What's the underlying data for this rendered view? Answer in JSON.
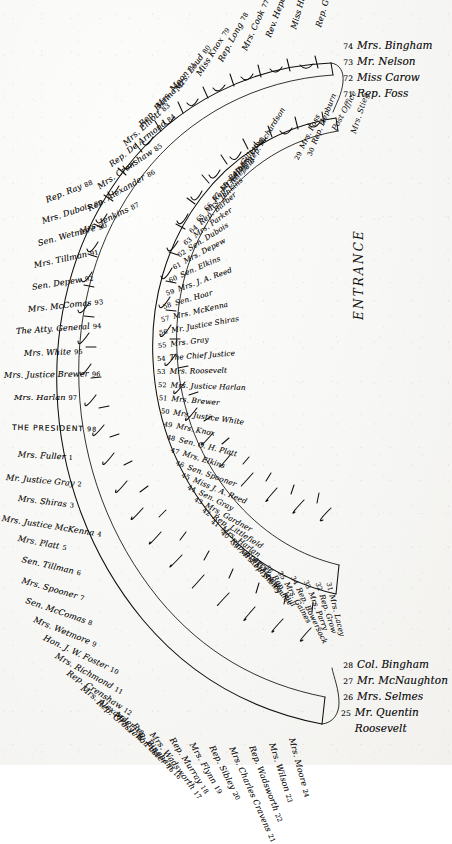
{
  "document": {
    "title": "White House Dinner Seating Chart",
    "type": "horseshoe-table-seating-plan",
    "entrance_label": "ENTRANCE",
    "post_office_label": "Post Office",
    "secondary_vertical_label": "Mrs. Stieg",
    "ink_color": "#100f0d",
    "paper_color": "#f7f7f5"
  },
  "legend_top": {
    "items": [
      {
        "num": "74",
        "name": "Mrs. Bingham"
      },
      {
        "num": "73",
        "name": "Mr. Nelson"
      },
      {
        "num": "72",
        "name": "Miss Carow"
      },
      {
        "num": "71",
        "name": "Rep. Foss"
      }
    ]
  },
  "legend_bottom": {
    "items": [
      {
        "num": "28",
        "name": "Col. Bingham"
      },
      {
        "num": "27",
        "name": "Mr. McNaughton"
      },
      {
        "num": "26",
        "name": "Mrs. Selmes"
      },
      {
        "num": "25",
        "name": "Mr. Quentin Roosevelt"
      }
    ]
  },
  "outer_table": {
    "description": "Outer arc of the horseshoe table, seats numbered 1-24 and 75-98",
    "seats": [
      {
        "num": "70",
        "name": "Rep. Gaines"
      },
      {
        "num": "75",
        "name": "Miss Hanna"
      },
      {
        "num": "76",
        "name": "Rev. Hepburn"
      },
      {
        "num": "77",
        "name": "Mrs. Cook"
      },
      {
        "num": "78",
        "name": "Rep. Long"
      },
      {
        "num": "79",
        "name": "Miss Knox"
      },
      {
        "num": "80",
        "name": "Mrs. Loud"
      },
      {
        "num": "81",
        "name": "Mrs. Moon"
      },
      {
        "num": "82",
        "name": "Rep. Hanna"
      },
      {
        "num": "83",
        "name": "Mrs. Elliott"
      },
      {
        "num": "84",
        "name": "Rep. De Armond"
      },
      {
        "num": "85",
        "name": "Mrs. Crenshaw"
      },
      {
        "num": "86",
        "name": "Rep. Alexander"
      },
      {
        "num": "87",
        "name": "Mrs. Jenkins"
      },
      {
        "num": "88",
        "name": "Rep. Ray"
      },
      {
        "num": "89",
        "name": "Mrs. Dubois"
      },
      {
        "num": "90",
        "name": "Sen. Wetmore"
      },
      {
        "num": "91",
        "name": "Mrs. Tillman"
      },
      {
        "num": "92",
        "name": "Sen. Depew"
      },
      {
        "num": "93",
        "name": "Mrs. McComas"
      },
      {
        "num": "94",
        "name": "The Atty. General"
      },
      {
        "num": "95",
        "name": "Mrs. White"
      },
      {
        "num": "96",
        "name": "Mrs. Justice Brewer"
      },
      {
        "num": "97",
        "name": "Mrs. Harlan"
      },
      {
        "num": "98",
        "name": "THE PRESIDENT"
      },
      {
        "num": "1",
        "name": "Mrs. Fuller"
      },
      {
        "num": "2",
        "name": "Mr. Justice Gray"
      },
      {
        "num": "3",
        "name": "Mrs. Shiras"
      },
      {
        "num": "4",
        "name": "Mrs. Justice McKenna"
      },
      {
        "num": "5",
        "name": "Mrs. Platt"
      },
      {
        "num": "6",
        "name": "Sen. Tillman"
      },
      {
        "num": "7",
        "name": "Mrs. Spooner"
      },
      {
        "num": "8",
        "name": "Sen. McComas"
      },
      {
        "num": "9",
        "name": "Mrs. Wetmore"
      },
      {
        "num": "10",
        "name": "Hon. J. W. Foster"
      },
      {
        "num": "11",
        "name": "Mrs. Richmond"
      },
      {
        "num": "12",
        "name": "Rep. Crenshaw"
      },
      {
        "num": "13",
        "name": "Mrs. Alexander"
      },
      {
        "num": "14",
        "name": "Rep. Grosvenor"
      },
      {
        "num": "15",
        "name": "Mrs. J. W. Foster"
      },
      {
        "num": "16",
        "name": "Rep. Bingham"
      },
      {
        "num": "17",
        "name": "Mrs. Wadsworth"
      },
      {
        "num": "18",
        "name": "Rep. Murray"
      },
      {
        "num": "19",
        "name": "Mrs. Flynn"
      },
      {
        "num": "20",
        "name": "Rep. Sibley"
      },
      {
        "num": "21",
        "name": "Mrs. Charles Cravens"
      },
      {
        "num": "22",
        "name": "Rep. Wadsworth"
      },
      {
        "num": "23",
        "name": "Mrs. Wilson"
      },
      {
        "num": "24",
        "name": "Mrs. Moore"
      }
    ]
  },
  "inner_table": {
    "description": "Inner arc of the horseshoe table, seats numbered 29-70",
    "seats": [
      {
        "num": "70",
        "name": "Rep. Richardson"
      },
      {
        "num": "69",
        "name": "Mrs. Long"
      },
      {
        "num": "68",
        "name": "Rep. Gillett"
      },
      {
        "num": "67",
        "name": "Mrs. Hoar"
      },
      {
        "num": "66",
        "name": "Rep. Littlefield"
      },
      {
        "num": "65",
        "name": "Mrs. Jenkins"
      },
      {
        "num": "64",
        "name": "Rep. Barber"
      },
      {
        "num": "63",
        "name": "Mrs. Parker"
      },
      {
        "num": "62",
        "name": "Sen. Dubois"
      },
      {
        "num": "61",
        "name": "Mrs. Depew"
      },
      {
        "num": "60",
        "name": "Sen. Elkins"
      },
      {
        "num": "59",
        "name": "Mrs. J. A. Reed"
      },
      {
        "num": "58",
        "name": "Sen. Hoar"
      },
      {
        "num": "57",
        "name": "Mrs. McKenna"
      },
      {
        "num": "56",
        "name": "Mr. Justice Shiras"
      },
      {
        "num": "55",
        "name": "Mrs. Gray"
      },
      {
        "num": "54",
        "name": "The Chief Justice"
      },
      {
        "num": "53",
        "name": "Mrs. Roosevelt"
      },
      {
        "num": "52",
        "name": "Mrs. Justice Harlan"
      },
      {
        "num": "51",
        "name": "Mrs. Brewer"
      },
      {
        "num": "50",
        "name": "Mrs. Justice White"
      },
      {
        "num": "49",
        "name": "Mrs. Knox"
      },
      {
        "num": "48",
        "name": "Sen. O. H. Platt"
      },
      {
        "num": "47",
        "name": "Mrs. Elkins"
      },
      {
        "num": "46",
        "name": "Sen. Spooner"
      },
      {
        "num": "45",
        "name": "Miss J. A. Reed"
      },
      {
        "num": "44",
        "name": "Sen. Gray"
      },
      {
        "num": "43",
        "name": "Mrs. Gardner"
      },
      {
        "num": "42",
        "name": "Rep. Littlefield"
      },
      {
        "num": "41",
        "name": "Mrs. Harlan"
      },
      {
        "num": "40",
        "name": "Rep. Sperry"
      },
      {
        "num": "39",
        "name": "Mrs. Mayhew"
      },
      {
        "num": "38",
        "name": "Rep. Sibley"
      },
      {
        "num": "37",
        "name": "Mrs. Foulke"
      },
      {
        "num": "36",
        "name": "Rep. Hull"
      },
      {
        "num": "35",
        "name": "Mrs. Gaines"
      },
      {
        "num": "34",
        "name": "Rep. Bowersock"
      },
      {
        "num": "33",
        "name": "Mrs. Parry"
      },
      {
        "num": "32",
        "name": "Rep. Grow"
      },
      {
        "num": "31",
        "name": "Mrs. Lacey"
      },
      {
        "num": "30",
        "name": "Rep. Hepburn"
      },
      {
        "num": "29",
        "name": "Mrs. Foss"
      }
    ]
  }
}
